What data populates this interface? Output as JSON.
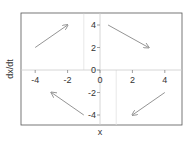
{
  "chart_data": {
    "type": "quiver",
    "title": "",
    "xlabel": "x",
    "ylabel": "dx/dt",
    "xlim": [
      -5,
      5
    ],
    "ylim": [
      -5,
      5
    ],
    "x_ticks": [
      -4,
      -2,
      0,
      2,
      4
    ],
    "y_ticks": [
      -4,
      -2,
      0,
      2,
      4
    ],
    "x_tick_labels": [
      "-4",
      "-2",
      "0",
      "2",
      "4"
    ],
    "y_tick_labels": [
      "-4",
      "-2",
      "0",
      "2",
      "4"
    ],
    "grid": false,
    "axes_through_origin": true,
    "reference_lines": [
      {
        "orientation": "vertical",
        "x": -1,
        "y_from": 0,
        "y_to": 5
      },
      {
        "orientation": "vertical",
        "x": 1,
        "y_from": -5,
        "y_to": 0
      }
    ],
    "arrows": [
      {
        "from": [
          -4,
          2
        ],
        "to": [
          -2,
          4
        ],
        "quadrant": "top-left"
      },
      {
        "from": [
          0.5,
          4
        ],
        "to": [
          3,
          2
        ],
        "quadrant": "top-right"
      },
      {
        "from": [
          -1,
          -4
        ],
        "to": [
          -3,
          -2
        ],
        "quadrant": "bottom-left"
      },
      {
        "from": [
          4,
          -2
        ],
        "to": [
          2,
          -4
        ],
        "quadrant": "bottom-right"
      }
    ],
    "colors": {
      "arrow": "#888888",
      "frame": "#555555",
      "axis": "#cccccc",
      "text": "#333333"
    }
  }
}
